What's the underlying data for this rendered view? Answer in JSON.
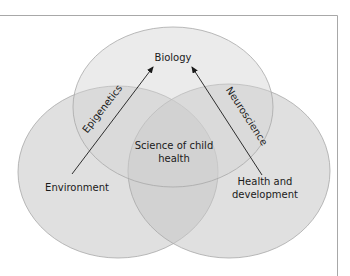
{
  "diagram": {
    "type": "venn",
    "colors": {
      "background": "#ffffff",
      "frame": "#a8a8a8",
      "circle_fill": "#c8c8c8",
      "circle_stroke": "#a0a0a0",
      "arrow": "#1a1a1a",
      "text": "#1a1a1a"
    },
    "circles": [
      {
        "id": "biology",
        "label": "Biology"
      },
      {
        "id": "environment",
        "label": "Environment"
      },
      {
        "id": "health",
        "label_line1": "Health and",
        "label_line2": "development"
      }
    ],
    "center": {
      "label_line1": "Science of child",
      "label_line2": "health"
    },
    "arrows": [
      {
        "from": "Environment",
        "to": "Biology",
        "label": "Epigenetics"
      },
      {
        "from": "Health and development",
        "to": "Biology",
        "label": "Neuroscience"
      }
    ]
  }
}
